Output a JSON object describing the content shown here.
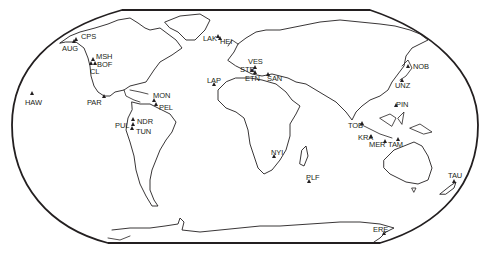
{
  "map": {
    "projection": "world-outline",
    "frame_color": "#231f20",
    "coast_color": "#231f20",
    "background": "#ffffff"
  },
  "sites": [
    {
      "code": "CPS",
      "lx": 81,
      "ly": 33,
      "mx": 76,
      "my": 39
    },
    {
      "code": "AUG",
      "lx": 62,
      "ly": 45,
      "mx": 74,
      "my": 41
    },
    {
      "code": "MSH",
      "lx": 96,
      "ly": 53,
      "mx": 93,
      "my": 59
    },
    {
      "code": "BOF",
      "lx": 97,
      "ly": 61,
      "mx": 95,
      "my": 63
    },
    {
      "code": "CL",
      "lx": 90,
      "ly": 68,
      "mx": 91,
      "my": 63
    },
    {
      "code": "HAW",
      "lx": 25,
      "ly": 99,
      "mx": 32,
      "my": 93
    },
    {
      "code": "PAR",
      "lx": 87,
      "ly": 99,
      "mx": 104,
      "my": 96
    },
    {
      "code": "MON",
      "lx": 153,
      "ly": 92,
      "mx": 154,
      "my": 100
    },
    {
      "code": "PEL",
      "lx": 159,
      "ly": 104,
      "mx": 156,
      "my": 104
    },
    {
      "code": "NDR",
      "lx": 137,
      "ly": 118,
      "mx": 133,
      "my": 119
    },
    {
      "code": "PUL",
      "lx": 115,
      "ly": 122,
      "mx": 133,
      "my": 124
    },
    {
      "code": "TUN",
      "lx": 136,
      "ly": 128,
      "mx": 132,
      "my": 128
    },
    {
      "code": "LAK",
      "lx": 203,
      "ly": 35,
      "mx": 218,
      "my": 36
    },
    {
      "code": "HEI",
      "lx": 220,
      "ly": 38,
      "mx": 220,
      "my": 38
    },
    {
      "code": "LAP",
      "lx": 207,
      "ly": 77,
      "mx": 214,
      "my": 84
    },
    {
      "code": "VES",
      "lx": 248,
      "ly": 58,
      "mx": 255,
      "my": 67
    },
    {
      "code": "STR",
      "lx": 240,
      "ly": 66,
      "mx": 252,
      "my": 70
    },
    {
      "code": "ETN",
      "lx": 245,
      "ly": 75,
      "mx": 255,
      "my": 72
    },
    {
      "code": "SAN",
      "lx": 267,
      "ly": 75,
      "mx": 268,
      "my": 74
    },
    {
      "code": "NYI",
      "lx": 271,
      "ly": 149,
      "mx": 274,
      "my": 156
    },
    {
      "code": "PLF",
      "lx": 306,
      "ly": 174,
      "mx": 309,
      "my": 181
    },
    {
      "code": "NOB",
      "lx": 413,
      "ly": 63,
      "mx": 408,
      "my": 66
    },
    {
      "code": "UNZ",
      "lx": 395,
      "ly": 82,
      "mx": 402,
      "my": 80
    },
    {
      "code": "PIN",
      "lx": 396,
      "ly": 101,
      "mx": 396,
      "my": 105
    },
    {
      "code": "TOB",
      "lx": 348,
      "ly": 122,
      "mx": 362,
      "my": 123
    },
    {
      "code": "KRA",
      "lx": 358,
      "ly": 134,
      "mx": 371,
      "my": 136
    },
    {
      "code": "MER",
      "lx": 369,
      "ly": 141,
      "mx": 385,
      "my": 141
    },
    {
      "code": "TAM",
      "lx": 388,
      "ly": 141,
      "mx": 398,
      "my": 139
    },
    {
      "code": "TAU",
      "lx": 448,
      "ly": 172,
      "mx": 454,
      "my": 181
    },
    {
      "code": "ERE",
      "lx": 373,
      "ly": 226,
      "mx": 384,
      "my": 233
    }
  ]
}
